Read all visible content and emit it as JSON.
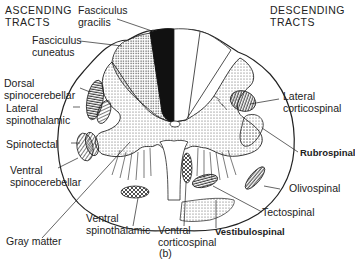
{
  "headings": {
    "ascending": [
      "ASCENDING",
      "TRACTS"
    ],
    "descending": [
      "DESCENDING",
      "TRACTS"
    ]
  },
  "ascending_tracts": [
    {
      "id": "fasciculus-gracilis",
      "lines": [
        "Fasciculus",
        "gracilis"
      ]
    },
    {
      "id": "fasciculus-cuneatus",
      "lines": [
        "Fasciculus",
        "cuneatus"
      ]
    },
    {
      "id": "dorsal-spinocerebellar",
      "lines": [
        "Dorsal",
        "spinocerebellar"
      ]
    },
    {
      "id": "lateral-spinothalamic",
      "lines": [
        "Lateral",
        "spinothalamic"
      ]
    },
    {
      "id": "spinotectal",
      "lines": [
        "Spinotectal"
      ]
    },
    {
      "id": "ventral-spinocerebellar",
      "lines": [
        "Ventral",
        "spinocerebellar"
      ]
    },
    {
      "id": "ventral-spinothalamic",
      "lines": [
        "Ventral",
        "spinothalamic"
      ]
    }
  ],
  "descending_tracts": [
    {
      "id": "lateral-corticospinal",
      "lines": [
        "Lateral",
        "corticospinal"
      ]
    },
    {
      "id": "rubrospinal",
      "lines": [
        "Rubrospinal"
      ]
    },
    {
      "id": "olivospinal",
      "lines": [
        "Olivospinal"
      ]
    },
    {
      "id": "tectospinal",
      "lines": [
        "Tectospinal"
      ]
    },
    {
      "id": "vestibulospinal",
      "lines": [
        "Vestibulospinal"
      ]
    },
    {
      "id": "ventral-corticospinal",
      "lines": [
        "Ventral",
        "corticospinal"
      ]
    }
  ],
  "other_labels": {
    "gray_matter": "Gray matter",
    "panel_letter": "(b)"
  }
}
